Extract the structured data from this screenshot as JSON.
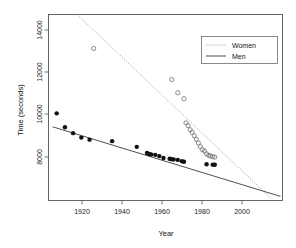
{
  "figure": {
    "background_color": "#ffffff",
    "frame_color": "#555555"
  },
  "axis": {
    "x_title": "Year",
    "y_title": "Time (seconds)",
    "x_ticks": [
      "1920",
      "1940",
      "1960",
      "1980",
      "2000"
    ],
    "y_ticks": [
      "8000",
      "10000",
      "12000",
      "14000"
    ]
  },
  "legend": {
    "entries": [
      {
        "label": "Women",
        "style": "dotted",
        "color": "#9a9a9a"
      },
      {
        "label": "Men",
        "style": "solid",
        "color": "#3b3b3b"
      }
    ]
  },
  "chart_data": {
    "type": "scatter",
    "title": "",
    "xlabel": "Year",
    "ylabel": "Time (seconds)",
    "xlim": [
      1904,
      2018
    ],
    "ylim": [
      6700,
      14850
    ],
    "grid": false,
    "legend_position": "top-right",
    "xticks": [
      1920,
      1940,
      1960,
      1980,
      2000
    ],
    "yticks": [
      8000,
      10000,
      12000,
      14000
    ],
    "series": [
      {
        "name": "Men",
        "marker": "filled-circle",
        "color": "#111111",
        "points": [
          [
            1908,
            10518
          ],
          [
            1912,
            9907
          ],
          [
            1916,
            9650
          ],
          [
            1920,
            9456
          ],
          [
            1924,
            9366
          ],
          [
            1935,
            9300
          ],
          [
            1947,
            9051
          ],
          [
            1952,
            8780
          ],
          [
            1953,
            8740
          ],
          [
            1954,
            8720
          ],
          [
            1956,
            8700
          ],
          [
            1958,
            8645
          ],
          [
            1960,
            8560
          ],
          [
            1963,
            8530
          ],
          [
            1964,
            8510
          ],
          [
            1965,
            8500
          ],
          [
            1967,
            8480
          ],
          [
            1969,
            8420
          ],
          [
            1970,
            8400
          ],
          [
            1981,
            8290
          ],
          [
            1984,
            8270
          ],
          [
            1985,
            8265
          ]
        ]
      },
      {
        "name": "Women",
        "marker": "open-circle",
        "color": "#6e6e6e",
        "points": [
          [
            1926,
            13360
          ],
          [
            1964,
            12000
          ],
          [
            1967,
            11420
          ],
          [
            1970,
            11160
          ],
          [
            1971,
            10100
          ],
          [
            1972,
            9980
          ],
          [
            1973,
            9800
          ],
          [
            1974,
            9690
          ],
          [
            1975,
            9540
          ],
          [
            1976,
            9380
          ],
          [
            1977,
            9220
          ],
          [
            1978,
            9060
          ],
          [
            1979,
            8930
          ],
          [
            1980,
            8870
          ],
          [
            1981,
            8740
          ],
          [
            1982,
            8680
          ],
          [
            1983,
            8650
          ],
          [
            1984,
            8620
          ],
          [
            1985,
            8600
          ]
        ]
      }
    ],
    "fits": [
      {
        "name": "Men",
        "style": "solid",
        "color": "#3b3b3b",
        "endpoints": [
          [
            1906,
            9930
          ],
          [
            2017,
            6880
          ]
        ]
      },
      {
        "name": "Women",
        "style": "dotted",
        "color": "#9a9a9a",
        "endpoints": [
          [
            1918,
            14840
          ],
          [
            2012,
            6830
          ]
        ]
      }
    ]
  }
}
